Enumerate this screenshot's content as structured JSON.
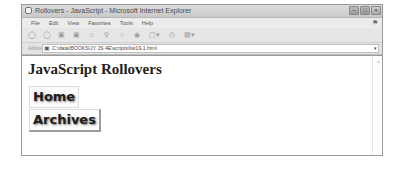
{
  "window": {
    "title": "Rollovers - JavaScript - Microsoft Internet Explorer",
    "controls": {
      "minimize": "–",
      "maximize": "□",
      "close": "×"
    }
  },
  "menubar": {
    "items": [
      {
        "label": "File"
      },
      {
        "label": "Edit"
      },
      {
        "label": "View"
      },
      {
        "label": "Favorites"
      },
      {
        "label": "Tools"
      },
      {
        "label": "Help"
      }
    ]
  },
  "toolbar": {
    "icons": [
      {
        "name": "back-icon",
        "glyph": "◯"
      },
      {
        "name": "forward-icon",
        "glyph": "◯"
      },
      {
        "name": "stop-icon",
        "glyph": "▣"
      },
      {
        "name": "refresh-icon",
        "glyph": "▣"
      },
      {
        "name": "home-icon",
        "glyph": "⌂"
      },
      {
        "name": "search-icon",
        "glyph": "⚲"
      },
      {
        "name": "favorites-icon",
        "glyph": "☆"
      },
      {
        "name": "history-icon",
        "glyph": "◉"
      },
      {
        "name": "mail-icon",
        "glyph": "▢▾"
      },
      {
        "name": "print-icon",
        "glyph": "⎙"
      },
      {
        "name": "edit-icon",
        "glyph": "▤▾"
      }
    ]
  },
  "addressbar": {
    "label": "Address",
    "value": "C:\\data\\BOOKS\\JY JS 4E\\scripts\\list19.1.html",
    "dropdown_glyph": "▾"
  },
  "page": {
    "heading": "JavaScript Rollovers",
    "buttons": [
      {
        "label": "Home"
      },
      {
        "label": "Archives"
      }
    ]
  }
}
